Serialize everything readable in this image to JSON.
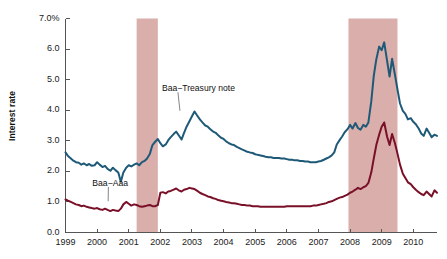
{
  "chart_data": {
    "type": "line",
    "title": "",
    "subtitle": "",
    "xlabel": "",
    "ylabel": "Interest rate",
    "xlim": [
      1999.0,
      2010.75
    ],
    "ylim": [
      0.0,
      7.0
    ],
    "grid": false,
    "legend_position": "inline-annotations",
    "y_ticks": [
      0.0,
      1.0,
      2.0,
      3.0,
      4.0,
      5.0,
      6.0,
      7.0
    ],
    "y_tick_labels": [
      "0.0",
      "1.0",
      "2.0",
      "3.0",
      "4.0",
      "5.0",
      "6.0",
      "7.0%"
    ],
    "x_ticks": [
      1999,
      2000,
      2001,
      2002,
      2003,
      2004,
      2005,
      2006,
      2007,
      2008,
      2009,
      2010
    ],
    "x_tick_labels": [
      "1999",
      "2000",
      "2001",
      "2002",
      "2003",
      "2004",
      "2005",
      "2006",
      "2007",
      "2008",
      "2009",
      "2010"
    ],
    "annotations": [
      {
        "name": "baa-treasury-note",
        "text": "Baa−Treasury note",
        "x": 2002.05,
        "y": 4.72,
        "leader_to_x": 2002.62,
        "leader_to_y": 3.98
      },
      {
        "name": "baa-aaa",
        "text": "Baa−Aaa",
        "x": 1999.85,
        "y": 1.62,
        "leader_to_x": 2000.35,
        "leader_to_y": 1.02
      }
    ],
    "shaded_regions": [
      {
        "name": "recession-2001",
        "label": "Recession 2001",
        "x_start": 2001.25,
        "x_end": 2001.92,
        "color": "#d9aeab"
      },
      {
        "name": "recession-2008-2009",
        "label": "Recession 2008-2009",
        "x_start": 2007.95,
        "x_end": 2009.5,
        "color": "#d9aeab"
      }
    ],
    "series": [
      {
        "name": "Baa−Treasury note",
        "color": "#1e5a78",
        "linewidth": 2.0,
        "x": [
          1999.0,
          1999.08,
          1999.17,
          1999.25,
          1999.33,
          1999.42,
          1999.5,
          1999.58,
          1999.67,
          1999.75,
          1999.83,
          1999.92,
          2000.0,
          2000.08,
          2000.17,
          2000.25,
          2000.33,
          2000.42,
          2000.5,
          2000.58,
          2000.67,
          2000.75,
          2000.83,
          2000.92,
          2001.0,
          2001.08,
          2001.17,
          2001.25,
          2001.33,
          2001.42,
          2001.5,
          2001.58,
          2001.67,
          2001.75,
          2001.83,
          2001.92,
          2002.0,
          2002.08,
          2002.17,
          2002.25,
          2002.33,
          2002.42,
          2002.5,
          2002.58,
          2002.67,
          2002.75,
          2002.83,
          2002.92,
          2003.0,
          2003.08,
          2003.17,
          2003.25,
          2003.33,
          2003.42,
          2003.5,
          2003.58,
          2003.67,
          2003.75,
          2003.83,
          2003.92,
          2004.0,
          2004.08,
          2004.17,
          2004.25,
          2004.33,
          2004.42,
          2004.5,
          2004.58,
          2004.67,
          2004.75,
          2004.83,
          2004.92,
          2005.0,
          2005.08,
          2005.17,
          2005.25,
          2005.33,
          2005.42,
          2005.5,
          2005.58,
          2005.67,
          2005.75,
          2005.83,
          2005.92,
          2006.0,
          2006.08,
          2006.17,
          2006.25,
          2006.33,
          2006.42,
          2006.5,
          2006.58,
          2006.67,
          2006.75,
          2006.83,
          2006.92,
          2007.0,
          2007.08,
          2007.17,
          2007.25,
          2007.33,
          2007.42,
          2007.5,
          2007.58,
          2007.67,
          2007.75,
          2007.83,
          2007.92,
          2008.0,
          2008.08,
          2008.17,
          2008.25,
          2008.33,
          2008.42,
          2008.5,
          2008.58,
          2008.67,
          2008.75,
          2008.83,
          2008.92,
          2009.0,
          2009.08,
          2009.17,
          2009.25,
          2009.33,
          2009.42,
          2009.5,
          2009.58,
          2009.67,
          2009.75,
          2009.83,
          2009.92,
          2010.0,
          2010.08,
          2010.17,
          2010.25,
          2010.33,
          2010.42,
          2010.5,
          2010.58,
          2010.67,
          2010.75
        ],
        "y": [
          2.62,
          2.5,
          2.42,
          2.35,
          2.3,
          2.28,
          2.22,
          2.26,
          2.2,
          2.24,
          2.18,
          2.2,
          2.3,
          2.22,
          2.14,
          2.18,
          2.08,
          2.02,
          2.12,
          2.04,
          1.96,
          1.66,
          1.96,
          2.12,
          2.2,
          2.16,
          2.22,
          2.26,
          2.2,
          2.3,
          2.34,
          2.42,
          2.58,
          2.86,
          2.96,
          3.06,
          2.92,
          2.82,
          2.88,
          3.02,
          3.12,
          3.22,
          3.3,
          3.18,
          3.04,
          3.26,
          3.46,
          3.64,
          3.8,
          3.96,
          3.82,
          3.7,
          3.6,
          3.5,
          3.46,
          3.38,
          3.3,
          3.26,
          3.18,
          3.1,
          3.06,
          2.98,
          2.92,
          2.88,
          2.86,
          2.8,
          2.76,
          2.72,
          2.68,
          2.64,
          2.62,
          2.6,
          2.56,
          2.54,
          2.52,
          2.5,
          2.48,
          2.46,
          2.46,
          2.44,
          2.44,
          2.44,
          2.42,
          2.42,
          2.4,
          2.38,
          2.38,
          2.36,
          2.36,
          2.34,
          2.34,
          2.32,
          2.32,
          2.3,
          2.3,
          2.3,
          2.32,
          2.34,
          2.38,
          2.42,
          2.46,
          2.52,
          2.62,
          2.88,
          3.02,
          3.14,
          3.28,
          3.38,
          3.52,
          3.4,
          3.58,
          3.42,
          3.36,
          3.52,
          3.46,
          3.6,
          4.28,
          5.12,
          5.66,
          6.08,
          5.96,
          6.22,
          5.62,
          5.1,
          5.68,
          5.16,
          4.68,
          4.22,
          3.98,
          3.88,
          3.7,
          3.74,
          3.62,
          3.54,
          3.4,
          3.24,
          3.16,
          3.4,
          3.26,
          3.12,
          3.2,
          3.16
        ]
      },
      {
        "name": "Baa−Aaa",
        "color": "#7a1028",
        "linewidth": 2.0,
        "x": [
          1999.0,
          1999.08,
          1999.17,
          1999.25,
          1999.33,
          1999.42,
          1999.5,
          1999.58,
          1999.67,
          1999.75,
          1999.83,
          1999.92,
          2000.0,
          2000.08,
          2000.17,
          2000.25,
          2000.33,
          2000.42,
          2000.5,
          2000.58,
          2000.67,
          2000.75,
          2000.83,
          2000.92,
          2001.0,
          2001.08,
          2001.17,
          2001.25,
          2001.33,
          2001.42,
          2001.5,
          2001.58,
          2001.67,
          2001.75,
          2001.83,
          2001.92,
          2002.0,
          2002.08,
          2002.17,
          2002.25,
          2002.33,
          2002.42,
          2002.5,
          2002.58,
          2002.67,
          2002.75,
          2002.83,
          2002.92,
          2003.0,
          2003.08,
          2003.17,
          2003.25,
          2003.33,
          2003.42,
          2003.5,
          2003.58,
          2003.67,
          2003.75,
          2003.83,
          2003.92,
          2004.0,
          2004.08,
          2004.17,
          2004.25,
          2004.33,
          2004.42,
          2004.5,
          2004.58,
          2004.67,
          2004.75,
          2004.83,
          2004.92,
          2005.0,
          2005.08,
          2005.17,
          2005.25,
          2005.33,
          2005.42,
          2005.5,
          2005.58,
          2005.67,
          2005.75,
          2005.83,
          2005.92,
          2006.0,
          2006.08,
          2006.17,
          2006.25,
          2006.33,
          2006.42,
          2006.5,
          2006.58,
          2006.67,
          2006.75,
          2006.83,
          2006.92,
          2007.0,
          2007.08,
          2007.17,
          2007.25,
          2007.33,
          2007.42,
          2007.5,
          2007.58,
          2007.67,
          2007.75,
          2007.83,
          2007.92,
          2008.0,
          2008.08,
          2008.17,
          2008.25,
          2008.33,
          2008.42,
          2008.5,
          2008.58,
          2008.67,
          2008.75,
          2008.83,
          2008.92,
          2009.0,
          2009.08,
          2009.17,
          2009.25,
          2009.33,
          2009.42,
          2009.5,
          2009.58,
          2009.67,
          2009.75,
          2009.83,
          2009.92,
          2010.0,
          2010.08,
          2010.17,
          2010.25,
          2010.33,
          2010.42,
          2010.5,
          2010.58,
          2010.67,
          2010.75
        ],
        "y": [
          1.08,
          1.04,
          1.0,
          0.96,
          0.92,
          0.9,
          0.86,
          0.88,
          0.84,
          0.82,
          0.8,
          0.78,
          0.8,
          0.76,
          0.74,
          0.78,
          0.74,
          0.7,
          0.74,
          0.72,
          0.7,
          0.78,
          0.92,
          1.0,
          0.94,
          0.88,
          0.92,
          0.9,
          0.86,
          0.84,
          0.86,
          0.88,
          0.9,
          0.86,
          0.86,
          0.9,
          1.3,
          1.32,
          1.28,
          1.34,
          1.36,
          1.4,
          1.44,
          1.38,
          1.34,
          1.4,
          1.42,
          1.46,
          1.44,
          1.42,
          1.36,
          1.3,
          1.26,
          1.22,
          1.18,
          1.16,
          1.12,
          1.1,
          1.06,
          1.04,
          1.02,
          1.0,
          0.98,
          0.96,
          0.96,
          0.94,
          0.92,
          0.9,
          0.9,
          0.88,
          0.88,
          0.86,
          0.86,
          0.86,
          0.84,
          0.84,
          0.84,
          0.84,
          0.84,
          0.84,
          0.84,
          0.84,
          0.84,
          0.84,
          0.86,
          0.86,
          0.86,
          0.86,
          0.86,
          0.86,
          0.86,
          0.86,
          0.86,
          0.86,
          0.88,
          0.88,
          0.9,
          0.92,
          0.94,
          0.96,
          1.0,
          1.02,
          1.06,
          1.1,
          1.14,
          1.16,
          1.2,
          1.24,
          1.3,
          1.34,
          1.4,
          1.46,
          1.42,
          1.48,
          1.52,
          1.62,
          1.96,
          2.42,
          2.86,
          3.2,
          3.46,
          3.6,
          3.14,
          2.86,
          3.22,
          2.92,
          2.58,
          2.22,
          1.92,
          1.78,
          1.64,
          1.58,
          1.48,
          1.4,
          1.32,
          1.26,
          1.22,
          1.34,
          1.26,
          1.18,
          1.38,
          1.3
        ]
      }
    ]
  },
  "axis": {
    "y_title": "Interest rate"
  }
}
